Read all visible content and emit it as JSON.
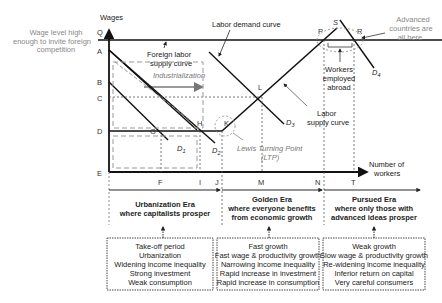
{
  "axes": {
    "y_label": "Wages",
    "x_label_line1": "Number of",
    "x_label_line2": "workers",
    "y_points": [
      "Q",
      "A",
      "B",
      "C",
      "D",
      "E"
    ],
    "x_points": [
      "F",
      "I",
      "J",
      "M",
      "N",
      "T"
    ]
  },
  "annotations": {
    "wage_level_line1": "Wage level high",
    "wage_level_line2": "enough to invite foreign",
    "wage_level_line3": "competition",
    "labor_demand_curve": "Labor demand curve",
    "foreign_supply_line1": "Foreign labor",
    "foreign_supply_line2": "supply curve",
    "industrialization": "Industrialization",
    "advanced_line1": "Advanced",
    "advanced_line2": "countries are",
    "advanced_line3": "all here",
    "workers_abroad_line1": "Workers",
    "workers_abroad_line2": "employed",
    "workers_abroad_line3": "abroad",
    "labor_supply_line1": "Labor",
    "labor_supply_line2": "supply curve",
    "ltp_line1": "Lewis Turning Point",
    "ltp_line2": "(LTP)"
  },
  "points": {
    "G": "G",
    "H": "H",
    "K": "K",
    "L": "L",
    "P": "P",
    "R": "R",
    "S": "S"
  },
  "curves": {
    "D1": "D",
    "D1_sub": "1",
    "D2": "D",
    "D2_sub": "2",
    "D3": "D",
    "D3_sub": "3",
    "D4": "D",
    "D4_sub": "4"
  },
  "eras": [
    {
      "title_line1": "Urbanization Era",
      "title_line2": "where capitalists prosper",
      "traits": [
        "Take-off period",
        "Urbanization",
        "Widening income inequality",
        "Strong investment",
        "Weak consumption"
      ]
    },
    {
      "title_line1": "Golden Era",
      "title_line2": "where everyone benefits",
      "title_line3": "from  economic growth",
      "traits": [
        "Fast growth",
        "Fast wage & productivity growth",
        "Narrowing income inequality",
        "Rapid increase in investment",
        "Rapid increase in consumption"
      ]
    },
    {
      "title_line1": "Pursued Era",
      "title_line2": "where only those with",
      "title_line3": "advanced ideas prosper",
      "traits": [
        "Weak growth",
        "Slow wage & productivity growth",
        "Re-widening income inequality",
        "Inferior return on capital",
        "Very careful consumers"
      ]
    }
  ]
}
